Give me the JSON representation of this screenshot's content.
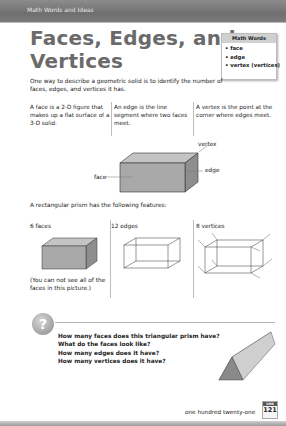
{
  "header": {
    "section": "Math Words and Ideas"
  },
  "title": {
    "line1": "Faces, Edges, and",
    "line2": "Vertices"
  },
  "math_words": {
    "heading": "Math Words",
    "items": [
      "• face",
      "• edge",
      "• vertex (vertices)"
    ]
  },
  "intro": "One way to describe a geometric solid is to identify the number of faces, edges, and vertices it has.",
  "definitions": [
    "A face is a 2-D figure that makes up a flat surface of a 3-D solid.",
    "An edge is the line segment where two faces meet.",
    "A vertex is the point at the corner where edges meet."
  ],
  "diagram_labels": {
    "vertex": "vertex",
    "edge": "edge",
    "face": "face"
  },
  "features_intro": "A rectangular prism has the following features:",
  "features": [
    {
      "title": "6 faces",
      "note": "(You can not see all of the faces in this picture.)"
    },
    {
      "title": "12 edges"
    },
    {
      "title": "8 vertices"
    }
  ],
  "questions": [
    "How many faces does this triangular prism have?",
    "What do the faces look like?",
    "How many edges does it have?",
    "How many vertices does it have?"
  ],
  "question_icon": "?",
  "footer": {
    "page_words": "one hundred twenty-one",
    "badge_label": "SMR",
    "page_number": "121"
  },
  "colors": {
    "header_gray": "#7a7a7a",
    "title_gray": "#6a6a6a",
    "solid_fill": "#a9a9a9"
  }
}
